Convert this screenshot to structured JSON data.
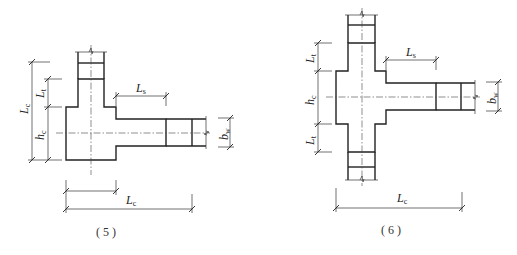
{
  "figures": [
    {
      "id": "5",
      "caption": "( 5 )",
      "labels": {
        "Lc_vertical": {
          "main": "L",
          "sub": "c"
        },
        "Lt": {
          "main": "L",
          "sub": "t"
        },
        "hc": {
          "main": "h",
          "sub": "c"
        },
        "Ls": {
          "main": "L",
          "sub": "s"
        },
        "bw": {
          "main": "b",
          "sub": "w"
        },
        "Lc_horizontal": {
          "main": "L",
          "sub": "c"
        }
      }
    },
    {
      "id": "6",
      "caption": "( 6 )",
      "labels": {
        "Lt_top": {
          "main": "L",
          "sub": "t"
        },
        "hc": {
          "main": "h",
          "sub": "c"
        },
        "Lt_bottom": {
          "main": "L",
          "sub": "t"
        },
        "Ls": {
          "main": "L",
          "sub": "s"
        },
        "bw": {
          "main": "b",
          "sub": "w"
        },
        "Lc_horizontal": {
          "main": "L",
          "sub": "c"
        }
      }
    }
  ],
  "colors": {
    "line": "#222222",
    "background": "#ffffff"
  }
}
